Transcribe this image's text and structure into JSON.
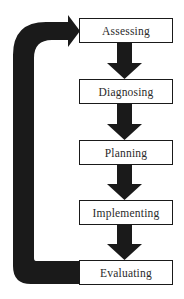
{
  "diagram": {
    "type": "cyclic-process-flow",
    "steps": [
      {
        "label": "Assessing"
      },
      {
        "label": "Diagnosing"
      },
      {
        "label": "Planning"
      },
      {
        "label": "Implementing"
      },
      {
        "label": "Evaluating"
      }
    ],
    "connectors": [
      {
        "from": "Assessing",
        "to": "Diagnosing",
        "kind": "down-arrow"
      },
      {
        "from": "Diagnosing",
        "to": "Planning",
        "kind": "down-arrow"
      },
      {
        "from": "Planning",
        "to": "Implementing",
        "kind": "down-arrow"
      },
      {
        "from": "Implementing",
        "to": "Evaluating",
        "kind": "down-arrow"
      },
      {
        "from": "Evaluating",
        "to": "Assessing",
        "kind": "feedback-loop-arrow"
      }
    ],
    "colors": {
      "arrow": "#1a1a1a",
      "box_border": "#1a1a1a",
      "box_fill": "#ffffff",
      "text": "#2a2a2a"
    }
  }
}
